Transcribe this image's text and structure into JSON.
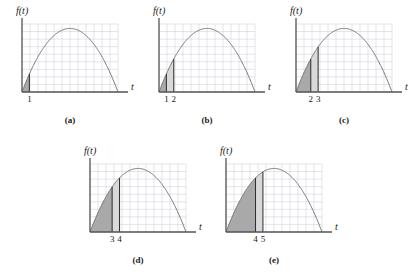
{
  "figure": {
    "kind": "calculus-figure",
    "background": "#ffffff",
    "axis_color": "#555555",
    "curve_color": "#777777",
    "grid_color": "#c9c9d6",
    "dark_fill": "#a9a9a9",
    "light_fill": "#d9d9d9",
    "marker_color": "#2b2b2b"
  },
  "chart_data": {
    "type": "area",
    "title": "",
    "xlabel": "t",
    "ylabel": "f(t)",
    "grid": true,
    "legend": "none",
    "xlim": [
      0,
      13
    ],
    "ylim": [
      0,
      7.2
    ],
    "curve_description": "f(t) = downward-opening parabola through (0,0) and (13,0) with peak near t = 5.6",
    "curve_roots": [
      0,
      13
    ],
    "curve_peak_x": 5.6,
    "curve_peak_y": 6.6,
    "panels": [
      {
        "id": "a",
        "caption": "(a)",
        "ylabel": "f(t)",
        "xlabel": "t",
        "tick_labels": [
          "1"
        ],
        "tick_values": [
          1
        ],
        "dark_shade": [
          0,
          1
        ],
        "light_shade": null,
        "marker_lines": [
          1
        ]
      },
      {
        "id": "b",
        "caption": "(b)",
        "ylabel": "f(t)",
        "xlabel": "t",
        "tick_labels": [
          "1",
          "2"
        ],
        "tick_values": [
          1,
          2
        ],
        "dark_shade": [
          0,
          1
        ],
        "light_shade": [
          1,
          2
        ],
        "marker_lines": [
          1,
          2
        ]
      },
      {
        "id": "c",
        "caption": "(c)",
        "ylabel": "f(t)",
        "xlabel": "t",
        "tick_labels": [
          "2",
          "3"
        ],
        "tick_values": [
          2,
          3
        ],
        "dark_shade": [
          0,
          2
        ],
        "light_shade": [
          2,
          3
        ],
        "marker_lines": [
          2,
          3
        ]
      },
      {
        "id": "d",
        "caption": "(d)",
        "ylabel": "f(t)",
        "xlabel": "t",
        "tick_labels": [
          "3",
          "4"
        ],
        "tick_values": [
          3,
          4
        ],
        "dark_shade": [
          0,
          3
        ],
        "light_shade": [
          3,
          4
        ],
        "marker_lines": [
          3,
          4
        ]
      },
      {
        "id": "e",
        "caption": "(e)",
        "ylabel": "f(t)",
        "xlabel": "t",
        "tick_labels": [
          "4",
          "5"
        ],
        "tick_values": [
          4,
          5
        ],
        "dark_shade": [
          0,
          4
        ],
        "light_shade": [
          4,
          5
        ],
        "marker_lines": [
          4,
          5
        ]
      }
    ]
  },
  "panel_layout": [
    {
      "left": 8,
      "top": 4,
      "plot_left": 14,
      "plot_top": 20,
      "plot_w": 96,
      "plot_h": 68
    },
    {
      "left": 145,
      "top": 4,
      "plot_left": 14,
      "plot_top": 20,
      "plot_w": 96,
      "plot_h": 68
    },
    {
      "left": 282,
      "top": 4,
      "plot_left": 14,
      "plot_top": 20,
      "plot_w": 96,
      "plot_h": 68
    },
    {
      "left": 76,
      "top": 144,
      "plot_left": 14,
      "plot_top": 20,
      "plot_w": 96,
      "plot_h": 68
    },
    {
      "left": 212,
      "top": 144,
      "plot_left": 14,
      "plot_top": 20,
      "plot_w": 96,
      "plot_h": 68
    }
  ]
}
